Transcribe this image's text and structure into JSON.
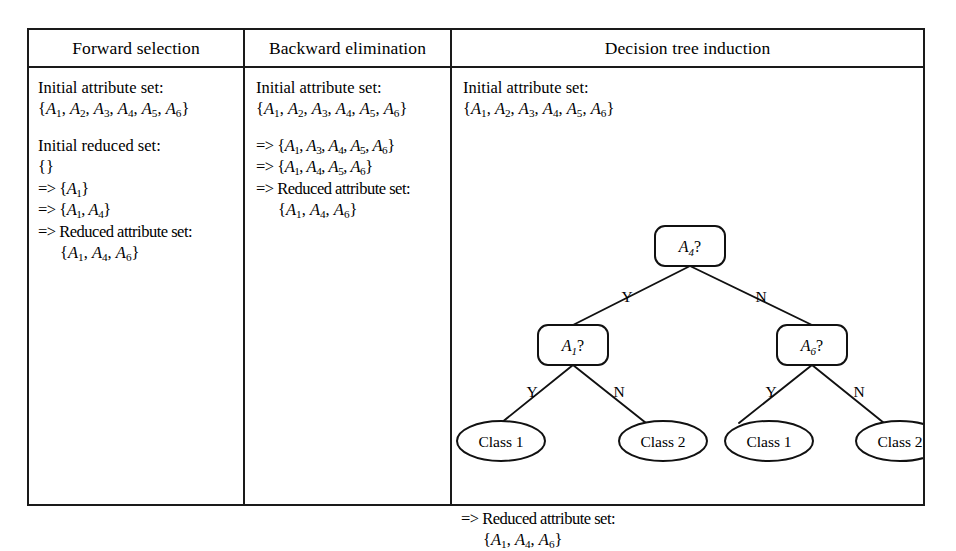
{
  "figure": {
    "columns": [
      {
        "key": "forward_selection",
        "header": "Forward selection",
        "lines": [
          {
            "type": "text",
            "text": "Initial attribute set:"
          },
          {
            "type": "set",
            "text": "{A1, A2, A3, A4, A5, A6}"
          },
          {
            "type": "spacer",
            "text": ""
          },
          {
            "type": "text",
            "text": "Initial reduced set:"
          },
          {
            "type": "set",
            "text": "{}"
          },
          {
            "type": "step",
            "text": "=> {A1}"
          },
          {
            "type": "step",
            "text": "=> {A1, A4}"
          },
          {
            "type": "step",
            "text": "=> Reduced attribute set:"
          },
          {
            "type": "indent-set",
            "text": "{A1, A4, A6}"
          }
        ]
      },
      {
        "key": "backward_elimination",
        "header": "Backward elimination",
        "lines": [
          {
            "type": "text",
            "text": "Initial attribute set:"
          },
          {
            "type": "set",
            "text": "{A1, A2, A3, A4, A5, A6}"
          },
          {
            "type": "spacer",
            "text": ""
          },
          {
            "type": "step",
            "text": "=> {A1, A3, A4, A5, A6}"
          },
          {
            "type": "step",
            "text": "=> {A1, A4, A5, A6}"
          },
          {
            "type": "step",
            "text": "=> Reduced attribute set:"
          },
          {
            "type": "indent-set",
            "text": "{A1, A4, A6}"
          }
        ]
      },
      {
        "key": "decision_tree_induction",
        "header": "Decision tree induction",
        "lines": [
          {
            "type": "text",
            "text": "Initial attribute set:"
          },
          {
            "type": "set",
            "text": "{A1, A2, A3, A4, A5, A6}"
          }
        ],
        "summary": [
          {
            "type": "step",
            "text": "=> Reduced attribute set:"
          },
          {
            "type": "indent-set",
            "text": "{A1, A4, A6}"
          }
        ]
      }
    ],
    "tree": {
      "root": {
        "label": "A4?",
        "attr": "A",
        "sub": "4",
        "x": 240,
        "y": 140
      },
      "internal_nodes": [
        {
          "id": "node-a1",
          "label": "A1?",
          "attr": "A",
          "sub": "1",
          "x": 123,
          "y": 239
        },
        {
          "id": "node-a6",
          "label": "A6?",
          "attr": "A",
          "sub": "6",
          "x": 362,
          "y": 239
        }
      ],
      "leaves": [
        {
          "id": "leaf-1",
          "label": "Class 1",
          "x": 51,
          "y": 335
        },
        {
          "id": "leaf-2",
          "label": "Class 2",
          "x": 213,
          "y": 335
        },
        {
          "id": "leaf-3",
          "label": "Class 1",
          "x": 319,
          "y": 335
        },
        {
          "id": "leaf-4",
          "label": "Class 2",
          "x": 450,
          "y": 335
        }
      ],
      "edges": [
        {
          "id": "edge-root-yes",
          "label": "Y",
          "lx": 177,
          "ly": 196
        },
        {
          "id": "edge-root-no",
          "label": "N",
          "lx": 311,
          "ly": 196
        },
        {
          "id": "edge-a1-yes",
          "label": "Y",
          "lx": 82,
          "ly": 291
        },
        {
          "id": "edge-a1-no",
          "label": "N",
          "lx": 169,
          "ly": 291
        },
        {
          "id": "edge-a6-yes",
          "label": "Y",
          "lx": 321,
          "ly": 291
        },
        {
          "id": "edge-a6-no",
          "label": "N",
          "lx": 409,
          "ly": 291
        }
      ]
    }
  },
  "colors": {
    "ink": "#1a1a1a",
    "background": "#ffffff",
    "stroke": "#111111"
  }
}
